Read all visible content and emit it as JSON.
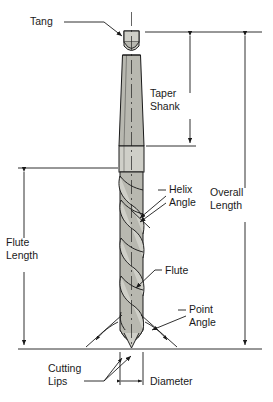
{
  "figure": {
    "background": "#ffffff",
    "line_color": "#1a1a1a",
    "metal_fill": "#b8b8b0",
    "metal_fill_light": "#cfcfc8",
    "text_color": "#1a1a1a"
  },
  "labels": {
    "tang": "Tang",
    "taper_shank_line1": "Taper",
    "taper_shank_line2": "Shank",
    "overall_length_line1": "Overall",
    "overall_length_line2": "Length",
    "flute_length_line1": "Flute",
    "flute_length_line2": "Length",
    "helix_angle_line1": "Helix",
    "helix_angle_line2": "Angle",
    "flute": "Flute",
    "point_angle_line1": "Point",
    "point_angle_line2": "Angle",
    "cutting_lips_line1": "Cutting",
    "cutting_lips_line2": "Lips",
    "diameter": "Diameter"
  },
  "parts": [
    {
      "name": "tang",
      "description": "flat driving tang at top of shank"
    },
    {
      "name": "taper-shank",
      "description": "tapered shank body"
    },
    {
      "name": "neck",
      "description": "straight neck between shank and flutes"
    },
    {
      "name": "flutes",
      "description": "helical flutes along cutting body"
    },
    {
      "name": "point",
      "description": "conical drill point with cutting lips"
    }
  ],
  "dimensions": [
    {
      "name": "taper-shank",
      "label": "Taper Shank",
      "side": "right-inner"
    },
    {
      "name": "overall-length",
      "label": "Overall Length",
      "side": "right-outer"
    },
    {
      "name": "flute-length",
      "label": "Flute Length",
      "side": "left"
    },
    {
      "name": "diameter",
      "label": "Diameter",
      "side": "bottom"
    }
  ],
  "annotations": [
    {
      "name": "tang",
      "label": "Tang"
    },
    {
      "name": "helix-angle",
      "label": "Helix Angle"
    },
    {
      "name": "flute",
      "label": "Flute"
    },
    {
      "name": "point-angle",
      "label": "Point Angle"
    },
    {
      "name": "cutting-lips",
      "label": "Cutting Lips"
    }
  ]
}
